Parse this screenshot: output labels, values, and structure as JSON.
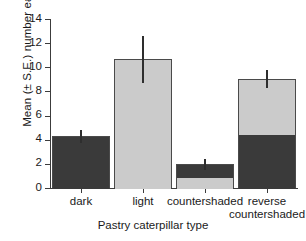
{
  "chart_data": {
    "type": "bar",
    "title": "",
    "xlabel": "Pastry caterpillar type",
    "ylabel": "Mean (± S.E.) number eaten",
    "categories": [
      "dark",
      "light",
      "countershaded",
      "reverse countershaded"
    ],
    "category_lines": [
      [
        "dark"
      ],
      [
        "light"
      ],
      [
        "countershaded"
      ],
      [
        "reverse",
        "countershaded"
      ]
    ],
    "values": [
      4.3,
      10.65,
      1.95,
      9.05
    ],
    "errors_low": [
      3.7,
      8.7,
      1.45,
      8.25
    ],
    "errors_high": [
      4.8,
      12.6,
      2.4,
      9.8
    ],
    "ylim": [
      0,
      14
    ],
    "yticks": [
      0,
      2,
      4,
      6,
      8,
      10,
      12,
      14
    ],
    "ytick_labels": [
      "0",
      "2",
      "4",
      "6",
      "8",
      "10",
      "12",
      "14"
    ],
    "grid": false,
    "legend": "none",
    "bar_segments": [
      {
        "category": "dark",
        "dark_from": 0,
        "dark_to": 4.3,
        "light_from": null,
        "light_to": null
      },
      {
        "category": "light",
        "dark_from": null,
        "dark_to": null,
        "light_from": 0,
        "light_to": 10.65
      },
      {
        "category": "countershaded",
        "dark_from": 0.95,
        "dark_to": 1.95,
        "light_from": 0,
        "light_to": 0.95
      },
      {
        "category": "reverse countershaded",
        "dark_from": 0,
        "dark_to": 4.5,
        "light_from": 4.5,
        "light_to": 9.05
      }
    ],
    "colors": {
      "dark_fill": "#3a3a3a",
      "light_fill": "#cbcbcb",
      "bar_edge": "#4a4a4a",
      "axis": "#3c3c3c",
      "error_bar": "#2e2e2e",
      "background": "#ffffff"
    }
  }
}
